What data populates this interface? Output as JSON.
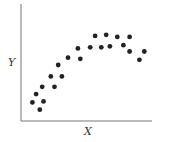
{
  "chart_data": {
    "type": "scatter",
    "title": "",
    "xlabel": "X",
    "ylabel": "Y",
    "grid": false,
    "legend": null,
    "xlim": [
      0,
      100
    ],
    "ylim": [
      0,
      100
    ],
    "tick_labels": {
      "x": [],
      "y": []
    },
    "points": [
      {
        "x": 6,
        "y": 14
      },
      {
        "x": 9,
        "y": 22
      },
      {
        "x": 12,
        "y": 7
      },
      {
        "x": 14,
        "y": 29
      },
      {
        "x": 15,
        "y": 15
      },
      {
        "x": 21,
        "y": 39
      },
      {
        "x": 24,
        "y": 29
      },
      {
        "x": 27,
        "y": 50
      },
      {
        "x": 30,
        "y": 39
      },
      {
        "x": 35,
        "y": 57
      },
      {
        "x": 43,
        "y": 66
      },
      {
        "x": 45,
        "y": 56
      },
      {
        "x": 53,
        "y": 67
      },
      {
        "x": 57,
        "y": 78
      },
      {
        "x": 62,
        "y": 67
      },
      {
        "x": 66,
        "y": 79
      },
      {
        "x": 69,
        "y": 68
      },
      {
        "x": 75,
        "y": 77
      },
      {
        "x": 80,
        "y": 69
      },
      {
        "x": 85,
        "y": 77
      },
      {
        "x": 85,
        "y": 63
      },
      {
        "x": 93,
        "y": 55
      },
      {
        "x": 97,
        "y": 63
      }
    ]
  },
  "colors": {
    "point": "#222222",
    "axis": "#777777",
    "label": "#333333"
  }
}
